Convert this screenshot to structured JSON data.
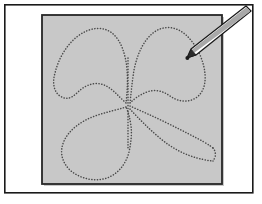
{
  "illustration": {
    "title": "Dotted four-leaf clover traced with a stylus",
    "caption": "",
    "canvas": {
      "width": 262,
      "height": 204,
      "background_color": "#ffffff"
    },
    "outer_frame": {
      "label": "Outer page border",
      "x": 4,
      "y": 4,
      "width": 249,
      "height": 189,
      "stroke_color": "#1a1a1a",
      "stroke_width": 1.6,
      "fill_color": "#ffffff"
    },
    "drawing_area": {
      "label": "Gray drawing canvas",
      "x": 42,
      "y": 15,
      "width": 180,
      "height": 169,
      "fill_color": "#c8c8c8",
      "stroke_color": "#262626",
      "stroke_width": 1.8,
      "shadow_color": "#8f8f8f"
    },
    "dotted_shape": {
      "label": "Four-leaf clover outline",
      "style": "dotted",
      "dot_color": "#4a4a4a",
      "dot_size": 1.45,
      "dash_pattern": "0.2 2.6",
      "stroke_width": 1.5,
      "leaves": [
        {
          "name": "upper-left-leaf",
          "path": "M 126 103 C 118 96 112 88 104 85 C 94 81 84 86 78 92 C 71 99 66 100 60 96 C 54 92 52 83 55 73 C 58 60 66 45 78 36 C 90 27 103 26 112 33 C 121 40 126 55 127 70 C 128 82 127 94 126 103 Z"
        },
        {
          "name": "upper-right-leaf",
          "path": "M 130 103 C 131 94 132 82 134 70 C 137 55 143 41 153 33 C 163 25 176 26 186 35 C 197 45 204 61 205 74 C 206 86 202 95 194 99 C 186 103 177 101 170 96 C 163 91 155 89 147 92 C 139 95 134 99 130 103 Z"
        },
        {
          "name": "lower-left-leaf",
          "path": "M 126 107 C 117 110 106 112 95 116 C 81 121 69 130 64 141 C 59 152 62 163 71 171 C 81 179 95 182 107 178 C 118 174 126 164 129 152 C 131 143 132 134 131 126 C 130 118 128 111 126 107 Z"
        },
        {
          "name": "lower-right-stem-upper",
          "path": "M 130 106 C 141 111 155 117 169 124 C 183 131 195 137 204 142 C 209 145 212 147 213 148"
        },
        {
          "name": "lower-right-stem-lower",
          "path": "M 130 109 C 138 118 149 129 161 139 C 173 149 186 155 197 158 C 205 160 210 161 213 161"
        },
        {
          "name": "lower-right-stem-cap",
          "path": "M 213 148 C 215 150 216 154 215 157 C 214 160 213 161 213 161"
        },
        {
          "name": "center-vertical-seam",
          "path": "M 128 60 C 128 72 128 86 128 100 C 128 114 128 130 128 146"
        }
      ]
    },
    "stylus": {
      "label": "Stylus pen tracing the outline",
      "body_fill": "#ffffff",
      "body_stroke": "#1a1a1a",
      "shade_fill": "#a8a8a8",
      "tip_fill": "#2b2b2b",
      "tip_point": {
        "x": 187,
        "y": 58
      },
      "tail_point": {
        "x": 251,
        "y": 11
      },
      "body_path": "M 251 11 L 246 6 L 191 49 L 187 58 L 196 55 Z",
      "shade_path": "M 251 11 L 246 6 L 191 49 L 193 52 Z",
      "tip_path": "M 187 58 L 196 55 L 191 49 Z",
      "contact_marker": {
        "x": 187,
        "y": 58,
        "r": 2.2
      }
    }
  }
}
